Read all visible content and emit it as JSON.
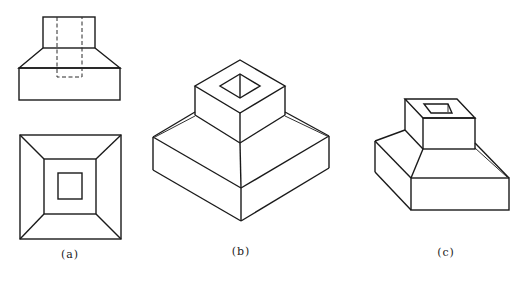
{
  "figure": {
    "colors": {
      "line": "#1a1a1a",
      "background": "#ffffff"
    },
    "panels": [
      {
        "id": "a",
        "caption": "(a)",
        "content": "Front view (with hidden-line dashed hole) and top view"
      },
      {
        "id": "b",
        "caption": "(b)",
        "content": "Isometric pictorial view"
      },
      {
        "id": "c",
        "caption": "(c)",
        "content": "Oblique pictorial view"
      }
    ]
  }
}
